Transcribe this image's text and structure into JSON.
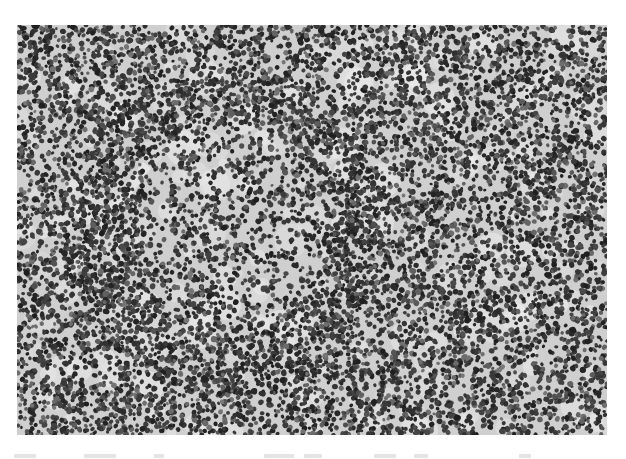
{
  "figure": {
    "type": "grayscale-micrograph",
    "background_color": "#ffffff",
    "image_box": {
      "x": 17,
      "y": 25,
      "width": 590,
      "height": 410
    },
    "tones": {
      "stroma": "#cfcfcf",
      "stroma_light": "#e2e2e2",
      "nucleus_dark": "#2a2a2a",
      "nucleus_mid": "#555555"
    },
    "structures": [
      {
        "name": "follicle-mantle",
        "cx": 205,
        "cy": 205,
        "rx": 150,
        "ry": 150,
        "density": 1.35
      },
      {
        "name": "germinal-center",
        "cx": 215,
        "cy": 200,
        "rx": 95,
        "ry": 110,
        "density": 0.75
      },
      {
        "name": "vessel-band",
        "x1": 50,
        "y1": 250,
        "x2": 130,
        "y2": 140,
        "width": 10
      }
    ],
    "clear_spaces": [
      {
        "cx": 110,
        "cy": 95,
        "r": 18
      },
      {
        "cx": 187,
        "cy": 410,
        "r": 12
      },
      {
        "cx": 455,
        "cy": 135,
        "r": 14
      },
      {
        "cx": 230,
        "cy": 160,
        "r": 14
      }
    ]
  },
  "caption": {
    "visible": true,
    "legible": false,
    "marks": [
      {
        "x": 0,
        "w": 22
      },
      {
        "x": 70,
        "w": 32
      },
      {
        "x": 140,
        "w": 10
      },
      {
        "x": 250,
        "w": 30
      },
      {
        "x": 290,
        "w": 18
      },
      {
        "x": 360,
        "w": 22
      },
      {
        "x": 400,
        "w": 14
      },
      {
        "x": 505,
        "w": 12
      }
    ]
  }
}
